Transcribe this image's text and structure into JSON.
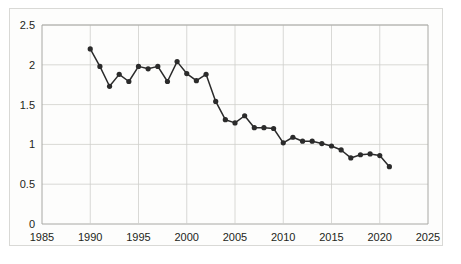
{
  "chart_data": {
    "type": "line",
    "title": "",
    "subtitle": "",
    "xlabel": "",
    "ylabel": "",
    "xlim": [
      1985,
      2025
    ],
    "ylim": [
      0,
      2.5
    ],
    "ytick_labels": [
      "0",
      "0.5",
      "1",
      "1.5",
      "2",
      "2.5"
    ],
    "ytick_values": [
      0,
      0.5,
      1,
      1.5,
      2,
      2.5
    ],
    "xtick_labels": [
      "1985",
      "1990",
      "1995",
      "2000",
      "2005",
      "2010",
      "2015",
      "2020",
      "2025"
    ],
    "xtick_values": [
      1985,
      1990,
      1995,
      2000,
      2005,
      2010,
      2015,
      2020,
      2025
    ],
    "grid": true,
    "legend": "none",
    "marker": "circle",
    "line_color": "#2b2b2b",
    "marker_color": "#2b2b2b",
    "grid_color": "#cfcfcb",
    "axis_color": "#a8a8a4",
    "background_color": "#fdfdfc",
    "x": [
      1990,
      1991,
      1992,
      1993,
      1994,
      1995,
      1996,
      1997,
      1998,
      1999,
      2000,
      2001,
      2002,
      2003,
      2004,
      2005,
      2006,
      2007,
      2008,
      2009,
      2010,
      2011,
      2012,
      2013,
      2014,
      2015,
      2016,
      2017,
      2018,
      2019,
      2020,
      2021
    ],
    "values": [
      2.2,
      1.98,
      1.73,
      1.88,
      1.79,
      1.98,
      1.95,
      1.98,
      1.79,
      2.04,
      1.89,
      1.8,
      1.88,
      1.54,
      1.31,
      1.27,
      1.36,
      1.21,
      1.21,
      1.2,
      1.02,
      1.09,
      1.04,
      1.04,
      1.01,
      0.98,
      0.93,
      0.83,
      0.87,
      0.88,
      0.86,
      0.72
    ],
    "series": [
      {
        "name": "",
        "values": [
          2.2,
          1.98,
          1.73,
          1.88,
          1.79,
          1.98,
          1.95,
          1.98,
          1.79,
          2.04,
          1.89,
          1.8,
          1.88,
          1.54,
          1.31,
          1.27,
          1.36,
          1.21,
          1.21,
          1.2,
          1.02,
          1.09,
          1.04,
          1.04,
          1.01,
          0.98,
          0.93,
          0.83,
          0.87,
          0.88,
          0.86,
          0.72
        ]
      }
    ]
  }
}
